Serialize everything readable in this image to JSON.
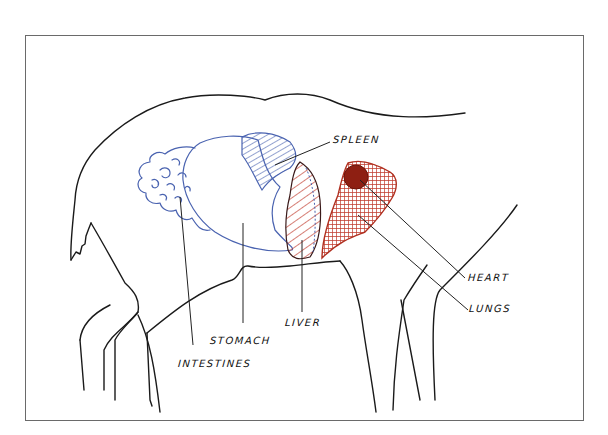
{
  "diagram": {
    "labels": {
      "spleen": "SPLEEN",
      "heart": "HEART",
      "lungs": "LUNGS",
      "liver": "LIVER",
      "stomach": "STOMACH",
      "intestines": "INTESTINES"
    },
    "colors": {
      "abdominal_organs": "#4a63b0",
      "thoracic_organs": "#c0392b",
      "heart_fill": "#8e1f12",
      "outline": "#1a1a1a",
      "frame": "#6a6a6a",
      "background": "#ffffff"
    }
  }
}
